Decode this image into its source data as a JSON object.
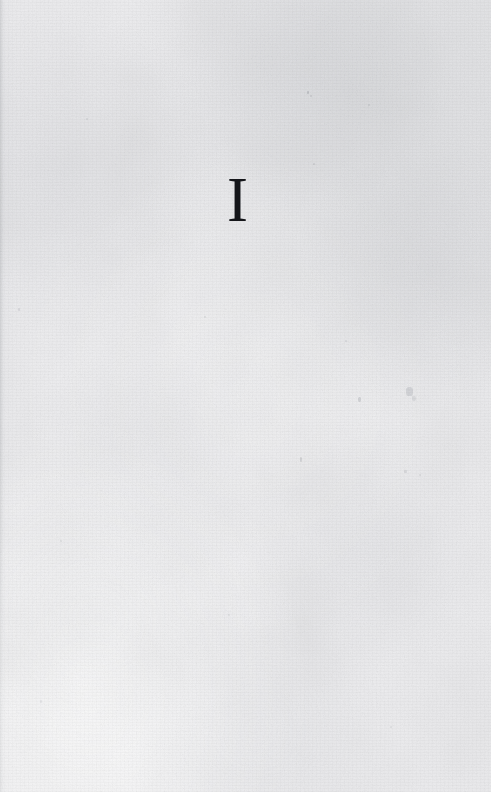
{
  "document": {
    "type": "book-part-title-page",
    "page_kind": "part-divider",
    "width": 491,
    "height": 792,
    "background_color": "#eeeef0",
    "ink_color": "#15161a"
  },
  "content": {
    "part_numeral": "I",
    "numeral_style": "roman",
    "numeral_alignment": "center",
    "body_text": "",
    "header": "",
    "footer": "",
    "page_number": ""
  },
  "artifacts": {
    "description": "scanned paper grain with scattered faint specks",
    "specks": [
      {
        "name": "speck-top-center",
        "x": 307,
        "y": 91,
        "w": 2,
        "h": 3,
        "opacity": 0.45
      },
      {
        "name": "speck-top-center-2",
        "x": 310,
        "y": 95,
        "w": 2,
        "h": 2,
        "opacity": 0.3
      },
      {
        "name": "speck-upper-left",
        "x": 86,
        "y": 118,
        "w": 2,
        "h": 2,
        "opacity": 0.28
      },
      {
        "name": "speck-upper-right",
        "x": 368,
        "y": 104,
        "w": 2,
        "h": 2,
        "opacity": 0.26
      },
      {
        "name": "speck-right-of-numeral",
        "x": 313,
        "y": 163,
        "w": 2,
        "h": 2,
        "opacity": 0.3
      },
      {
        "name": "speck-mid-left",
        "x": 18,
        "y": 308,
        "w": 2,
        "h": 3,
        "opacity": 0.3
      },
      {
        "name": "speck-mid-center",
        "x": 204,
        "y": 316,
        "w": 2,
        "h": 2,
        "opacity": 0.26
      },
      {
        "name": "speck-mid-right",
        "x": 345,
        "y": 340,
        "w": 2,
        "h": 2,
        "opacity": 0.28
      },
      {
        "name": "speck-foxing-right",
        "x": 406,
        "y": 387,
        "w": 7,
        "h": 9,
        "opacity": 0.34
      },
      {
        "name": "speck-foxing-right-2",
        "x": 412,
        "y": 396,
        "w": 4,
        "h": 5,
        "opacity": 0.26
      },
      {
        "name": "speck-center-right",
        "x": 358,
        "y": 397,
        "w": 3,
        "h": 5,
        "opacity": 0.4
      },
      {
        "name": "speck-center-low",
        "x": 300,
        "y": 457,
        "w": 2,
        "h": 5,
        "opacity": 0.38
      },
      {
        "name": "speck-right-low",
        "x": 404,
        "y": 470,
        "w": 3,
        "h": 3,
        "opacity": 0.3
      },
      {
        "name": "speck-right-low-2",
        "x": 419,
        "y": 474,
        "w": 2,
        "h": 2,
        "opacity": 0.24
      },
      {
        "name": "speck-lower-left",
        "x": 60,
        "y": 540,
        "w": 2,
        "h": 2,
        "opacity": 0.24
      },
      {
        "name": "speck-lower-center",
        "x": 228,
        "y": 614,
        "w": 2,
        "h": 2,
        "opacity": 0.22
      },
      {
        "name": "speck-bottom-left",
        "x": 40,
        "y": 700,
        "w": 2,
        "h": 3,
        "opacity": 0.22
      },
      {
        "name": "speck-bottom-right",
        "x": 390,
        "y": 726,
        "w": 2,
        "h": 2,
        "opacity": 0.22
      }
    ]
  }
}
